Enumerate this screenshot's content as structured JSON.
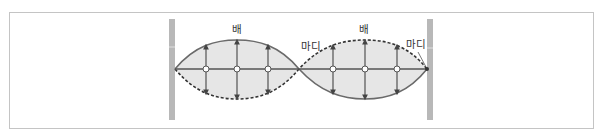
{
  "diagram": {
    "type": "standing-wave",
    "labels": {
      "antinode_1": "배",
      "node_1": "마디",
      "antinode_2": "배",
      "node_2": "마디"
    },
    "colors": {
      "wall": "#b3b3b3",
      "fill": "#e6e6e6",
      "line": "#666666",
      "dashed": "#333333",
      "frame": "#c4c4c4"
    },
    "loops": 2
  }
}
